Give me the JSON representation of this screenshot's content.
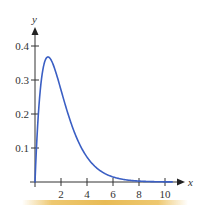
{
  "chart_data": {
    "type": "line",
    "title": "",
    "xlabel": "x",
    "ylabel": "y",
    "function": "y = x * e^(-x)",
    "xlim": [
      0,
      11
    ],
    "ylim": [
      0,
      0.45
    ],
    "grid": false,
    "legend": null,
    "x_ticks": [
      2,
      4,
      6,
      8,
      10
    ],
    "x_tick_labels": [
      "2",
      "4",
      "6",
      "8",
      "10"
    ],
    "y_ticks": [
      0.1,
      0.2,
      0.3,
      0.4
    ],
    "y_tick_labels": [
      "0.1",
      "0.2",
      "0.3",
      "0.4"
    ],
    "series": [
      {
        "name": "f(x)",
        "color": "#3b5fc4",
        "x": [
          0,
          0.1,
          0.2,
          0.3,
          0.5,
          0.75,
          1,
          1.25,
          1.5,
          2,
          2.5,
          3,
          3.5,
          4,
          5,
          6,
          7,
          8,
          9,
          10,
          11
        ],
        "y": [
          0,
          0.09,
          0.164,
          0.222,
          0.303,
          0.354,
          0.368,
          0.358,
          0.335,
          0.271,
          0.205,
          0.149,
          0.106,
          0.073,
          0.034,
          0.015,
          0.006,
          0.003,
          0.001,
          0.0005,
          0.0002
        ]
      }
    ]
  },
  "colors": {
    "curve": "#3b5fc4",
    "axis": "#333333",
    "accent_bar": "#e8bb55"
  }
}
